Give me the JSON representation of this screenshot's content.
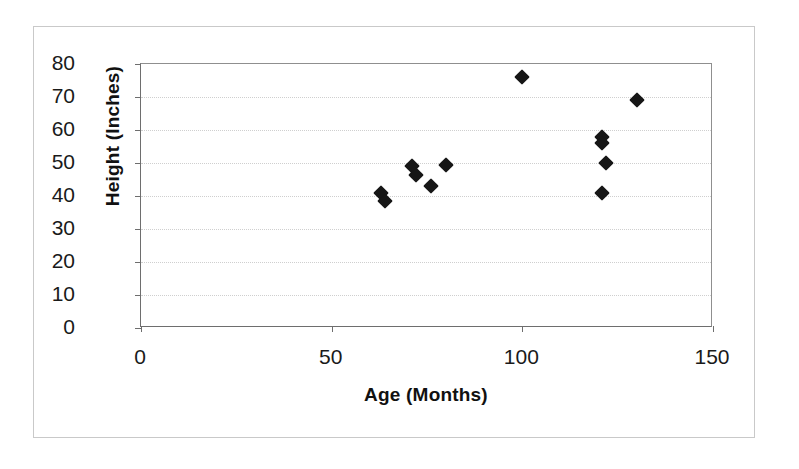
{
  "figure": {
    "background_color": "#ffffff",
    "frame_color": "#c9c9c9",
    "axis_color": "#6e6e6e",
    "gridline_color": "#cfcfcf",
    "marker_color": "#161616",
    "marker_shape": "diamond"
  },
  "chart_data": {
    "type": "scatter",
    "title": "",
    "xlabel": "Age (Months)",
    "ylabel": "Height (Inches)",
    "xlim": [
      0,
      150
    ],
    "ylim": [
      0,
      80
    ],
    "xticks": [
      0,
      50,
      100,
      150
    ],
    "yticks": [
      0,
      10,
      20,
      30,
      40,
      50,
      60,
      70,
      80
    ],
    "xtick_labels": [
      "0",
      "50",
      "100",
      "150"
    ],
    "ytick_labels": [
      "0",
      "10",
      "20",
      "30",
      "40",
      "50",
      "60",
      "70",
      "80"
    ],
    "grid": {
      "horizontal": true,
      "vertical": false,
      "style": "dotted"
    },
    "legend": null,
    "legend_position": "none",
    "series": [
      {
        "name": "Age vs Height",
        "marker": "diamond",
        "color": "#161616",
        "points": [
          {
            "x": 63,
            "y": 41
          },
          {
            "x": 64,
            "y": 38.5
          },
          {
            "x": 71,
            "y": 49
          },
          {
            "x": 72,
            "y": 46.5
          },
          {
            "x": 76,
            "y": 43
          },
          {
            "x": 80,
            "y": 49.5
          },
          {
            "x": 100,
            "y": 76
          },
          {
            "x": 121,
            "y": 58
          },
          {
            "x": 121,
            "y": 56
          },
          {
            "x": 122,
            "y": 50
          },
          {
            "x": 121,
            "y": 41
          },
          {
            "x": 130,
            "y": 69
          }
        ]
      }
    ]
  }
}
